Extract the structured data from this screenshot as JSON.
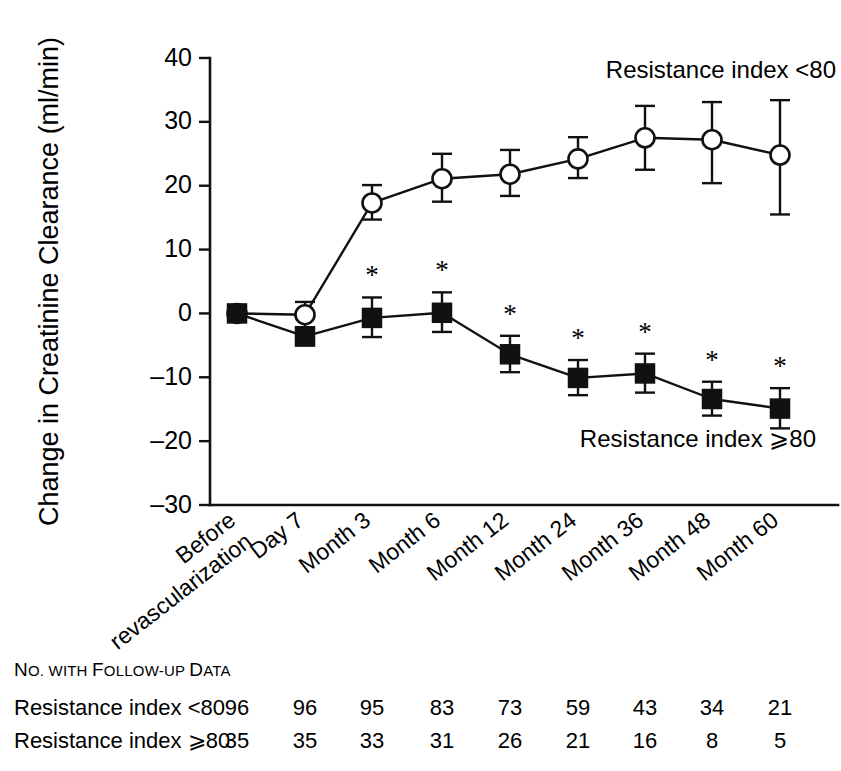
{
  "chart_data": {
    "type": "line",
    "title": "",
    "xlabel": "",
    "ylabel": "Change in Creatinine Clearance (ml/min)",
    "categories": [
      "Before revascularization",
      "Day 7",
      "Month 3",
      "Month 6",
      "Month 12",
      "Month 24",
      "Month 36",
      "Month 48",
      "Month 60"
    ],
    "ylim": [
      -30,
      40
    ],
    "yticks": [
      40,
      30,
      20,
      10,
      0,
      -10,
      -20,
      -30
    ],
    "ytick_labels": [
      "40",
      "30",
      "20",
      "10",
      "0",
      "–10",
      "–20",
      "–30"
    ],
    "grid": false,
    "legend_position": "inline-annotation",
    "series": [
      {
        "name": "Resistance index <80",
        "marker": "open-circle",
        "values": [
          0,
          -0.2,
          17.3,
          21.1,
          21.8,
          24.2,
          27.5,
          27.2,
          24.8
        ],
        "err_low": [
          0,
          2.0,
          2.6,
          3.6,
          3.4,
          3.0,
          5.0,
          6.8,
          9.3
        ],
        "err_high": [
          0,
          2.0,
          2.8,
          3.9,
          3.8,
          3.4,
          5.0,
          5.9,
          8.6
        ],
        "significance": [
          false,
          false,
          false,
          false,
          false,
          false,
          false,
          false,
          false
        ]
      },
      {
        "name": "Resistance index ⩾80",
        "marker": "filled-square",
        "values": [
          0,
          -3.6,
          -0.7,
          0.1,
          -6.4,
          -10.1,
          -9.4,
          -13.4,
          -14.9
        ],
        "err_low": [
          0,
          1.4,
          3.0,
          3.0,
          2.8,
          2.7,
          3.0,
          2.6,
          3.1
        ],
        "err_high": [
          0,
          1.4,
          3.2,
          3.2,
          2.9,
          2.8,
          3.1,
          2.7,
          3.2
        ],
        "significance": [
          false,
          false,
          true,
          true,
          true,
          true,
          true,
          true,
          true
        ]
      }
    ],
    "annotations": [
      {
        "text": "Resistance index <80",
        "anchor": "end"
      },
      {
        "text": "Resistance index ⩾80",
        "anchor": "end"
      }
    ],
    "significance_symbol": "*"
  },
  "footer_table": {
    "caption_parts": [
      {
        "text": "N",
        "small_caps": false
      },
      {
        "text": "O. WITH ",
        "small_caps": true
      },
      {
        "text": "F",
        "small_caps": false
      },
      {
        "text": "OLLOW-UP ",
        "small_caps": true
      },
      {
        "text": "D",
        "small_caps": false
      },
      {
        "text": "ATA",
        "small_caps": true
      }
    ],
    "caption": "No. with Follow-up Data",
    "rows": [
      {
        "label": "Resistance index <80",
        "values": [
          "96",
          "96",
          "95",
          "83",
          "73",
          "59",
          "43",
          "34",
          "21"
        ]
      },
      {
        "label": "Resistance index ⩾80",
        "values": [
          "35",
          "35",
          "33",
          "31",
          "26",
          "21",
          "16",
          "8",
          "5"
        ]
      }
    ]
  },
  "style": {
    "ink_color": "#111111",
    "background": "#ffffff",
    "open_marker_fill": "#ffffff"
  }
}
